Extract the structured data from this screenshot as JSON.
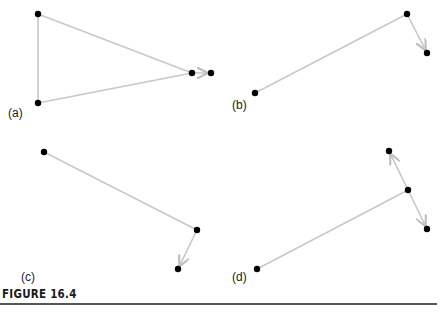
{
  "figure": {
    "caption": "FIGURE 16.4",
    "line_color": "#c8c8c8",
    "dot_color": "#000000",
    "panels": [
      {
        "label": "(a)",
        "label_pos": [
          8,
          118
        ],
        "nodes": [
          [
            38,
            14
          ],
          [
            38,
            103
          ],
          [
            192,
            73
          ],
          [
            211,
            73
          ]
        ],
        "edges": [
          [
            0,
            2
          ],
          [
            1,
            2
          ],
          [
            0,
            1
          ]
        ],
        "arrows": [
          [
            2,
            3
          ]
        ]
      },
      {
        "label": "(b)",
        "label_pos": [
          232,
          110
        ],
        "nodes": [
          [
            255,
            93
          ],
          [
            407,
            14
          ],
          [
            427,
            53
          ]
        ],
        "edges": [
          [
            0,
            1
          ]
        ],
        "arrows": [
          [
            1,
            2
          ]
        ]
      },
      {
        "label": "(c)",
        "label_pos": [
          21,
          282
        ],
        "nodes": [
          [
            44,
            152
          ],
          [
            197,
            230
          ],
          [
            178,
            269
          ]
        ],
        "edges": [
          [
            0,
            1
          ]
        ],
        "arrows": [
          [
            1,
            2
          ]
        ]
      },
      {
        "label": "(d)",
        "label_pos": [
          232,
          282
        ],
        "nodes": [
          [
            257,
            269
          ],
          [
            408,
            190
          ],
          [
            389,
            151
          ],
          [
            427,
            229
          ]
        ],
        "edges": [
          [
            0,
            1
          ]
        ],
        "arrows": [
          [
            1,
            2
          ],
          [
            1,
            3
          ]
        ]
      }
    ]
  }
}
